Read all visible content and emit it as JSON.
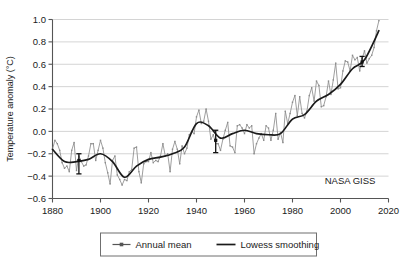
{
  "chart_data": {
    "type": "line",
    "title": "",
    "xlabel": "",
    "ylabel": "Temperature anomaly (°C)",
    "xlim": [
      1880,
      2020
    ],
    "ylim": [
      -0.6,
      1.0
    ],
    "xticks": [
      1880,
      1900,
      1920,
      1940,
      1960,
      1980,
      2000,
      2020
    ],
    "yticks": [
      -0.6,
      -0.4,
      -0.2,
      0.0,
      0.2,
      0.4,
      0.6,
      0.8,
      1.0
    ],
    "xtick_labels": [
      "1880",
      "1900",
      "1920",
      "1940",
      "1960",
      "1980",
      "2000",
      "2020"
    ],
    "ytick_labels": [
      "−0.6",
      "−0.4",
      "−0.2",
      "0.0",
      "0.2",
      "0.4",
      "0.6",
      "0.8",
      "1.0"
    ],
    "grid": "horizontal",
    "legend_position": "below",
    "annotations": [
      {
        "text": "NASA GISS",
        "x": 2004,
        "y": -0.47
      }
    ],
    "series": [
      {
        "name": "Annual mean",
        "style": "line-with-square-markers",
        "color": "#8c8c8c",
        "x": [
          1880,
          1881,
          1882,
          1883,
          1884,
          1885,
          1886,
          1887,
          1888,
          1889,
          1890,
          1891,
          1892,
          1893,
          1894,
          1895,
          1896,
          1897,
          1898,
          1899,
          1900,
          1901,
          1902,
          1903,
          1904,
          1905,
          1906,
          1907,
          1908,
          1909,
          1910,
          1911,
          1912,
          1913,
          1914,
          1915,
          1916,
          1917,
          1918,
          1919,
          1920,
          1921,
          1922,
          1923,
          1924,
          1925,
          1926,
          1927,
          1928,
          1929,
          1930,
          1931,
          1932,
          1933,
          1934,
          1935,
          1936,
          1937,
          1938,
          1939,
          1940,
          1941,
          1942,
          1943,
          1944,
          1945,
          1946,
          1947,
          1948,
          1949,
          1950,
          1951,
          1952,
          1953,
          1954,
          1955,
          1956,
          1957,
          1958,
          1959,
          1960,
          1961,
          1962,
          1963,
          1964,
          1965,
          1966,
          1967,
          1968,
          1969,
          1970,
          1971,
          1972,
          1973,
          1974,
          1975,
          1976,
          1977,
          1978,
          1979,
          1980,
          1981,
          1982,
          1983,
          1984,
          1985,
          1986,
          1987,
          1988,
          1989,
          1990,
          1991,
          1992,
          1993,
          1994,
          1995,
          1996,
          1997,
          1998,
          1999,
          2000,
          2001,
          2002,
          2003,
          2004,
          2005,
          2006,
          2007,
          2008,
          2009,
          2010,
          2011,
          2012,
          2013,
          2014,
          2015,
          2016
        ],
        "values": [
          -0.16,
          -0.08,
          -0.11,
          -0.17,
          -0.28,
          -0.33,
          -0.31,
          -0.36,
          -0.17,
          -0.1,
          -0.35,
          -0.22,
          -0.27,
          -0.31,
          -0.3,
          -0.22,
          -0.11,
          -0.11,
          -0.26,
          -0.17,
          -0.08,
          -0.15,
          -0.28,
          -0.37,
          -0.47,
          -0.26,
          -0.22,
          -0.39,
          -0.43,
          -0.48,
          -0.43,
          -0.44,
          -0.36,
          -0.34,
          -0.15,
          -0.14,
          -0.36,
          -0.46,
          -0.29,
          -0.27,
          -0.27,
          -0.19,
          -0.28,
          -0.26,
          -0.27,
          -0.22,
          -0.11,
          -0.22,
          -0.2,
          -0.36,
          -0.16,
          -0.09,
          -0.16,
          -0.29,
          -0.13,
          -0.2,
          -0.15,
          -0.03,
          0.0,
          -0.02,
          0.13,
          0.19,
          0.07,
          0.09,
          0.2,
          0.09,
          -0.07,
          -0.03,
          -0.11,
          -0.11,
          -0.17,
          -0.07,
          0.01,
          0.08,
          -0.13,
          -0.14,
          -0.19,
          0.05,
          0.06,
          0.03,
          -0.02,
          0.06,
          0.03,
          0.05,
          -0.2,
          -0.11,
          -0.06,
          -0.02,
          -0.08,
          0.05,
          0.03,
          -0.08,
          0.01,
          0.16,
          -0.07,
          -0.01,
          -0.1,
          0.18,
          0.07,
          0.16,
          0.26,
          0.32,
          0.14,
          0.31,
          0.16,
          0.12,
          0.18,
          0.32,
          0.39,
          0.27,
          0.45,
          0.41,
          0.22,
          0.23,
          0.31,
          0.45,
          0.33,
          0.46,
          0.61,
          0.38,
          0.39,
          0.54,
          0.63,
          0.62,
          0.54,
          0.68,
          0.64,
          0.66,
          0.54,
          0.65,
          0.72,
          0.61,
          0.65,
          0.68,
          0.75,
          0.9,
          0.99
        ]
      },
      {
        "name": "Lowess smoothing",
        "style": "smooth-line",
        "color": "#1a1a1a",
        "x": [
          1880,
          1885,
          1890,
          1895,
          1900,
          1905,
          1910,
          1915,
          1920,
          1925,
          1930,
          1935,
          1940,
          1945,
          1950,
          1955,
          1960,
          1965,
          1970,
          1975,
          1980,
          1985,
          1990,
          1995,
          2000,
          2005,
          2010,
          2016
        ],
        "values": [
          -0.16,
          -0.27,
          -0.27,
          -0.25,
          -0.2,
          -0.27,
          -0.41,
          -0.31,
          -0.25,
          -0.23,
          -0.2,
          -0.14,
          0.07,
          0.05,
          -0.06,
          -0.02,
          0.01,
          -0.02,
          -0.03,
          -0.02,
          0.11,
          0.15,
          0.27,
          0.33,
          0.42,
          0.56,
          0.64,
          0.9
        ]
      }
    ],
    "error_bars": [
      {
        "x": 1891,
        "y": -0.26,
        "low": -0.38,
        "high": -0.2
      },
      {
        "x": 1948,
        "y": -0.08,
        "low": -0.19,
        "high": 0.01
      },
      {
        "x": 2009,
        "y": 0.62,
        "low": 0.58,
        "high": 0.67
      }
    ],
    "legend": [
      {
        "label": "Annual mean",
        "marker": "square",
        "color": "#555555"
      },
      {
        "label": "Lowess smoothing",
        "marker": "line",
        "color": "#1a1a1a"
      }
    ]
  }
}
